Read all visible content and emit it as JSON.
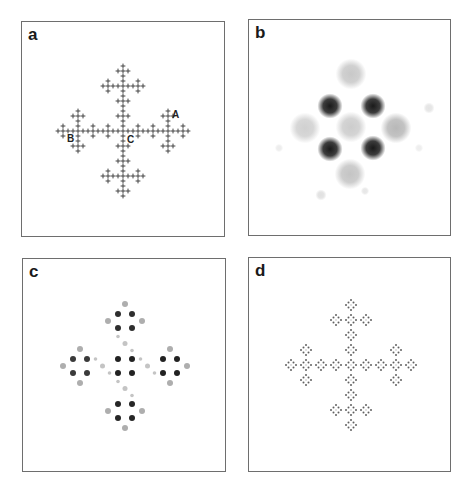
{
  "figure": {
    "panels": [
      {
        "id": "a",
        "label": "a",
        "box": {
          "x": 21,
          "y": 21,
          "w": 204,
          "h": 216
        },
        "type": "cross-fractal-plus",
        "center": [
          101,
          109
        ],
        "spacings": [
          45,
          15,
          5
        ],
        "glyph_size": 2.4,
        "color": "#444444",
        "point_labels": [
          {
            "text": "A",
            "x": 150,
            "y": 96
          },
          {
            "text": "B",
            "x": 45,
            "y": 120
          },
          {
            "text": "C",
            "x": 105,
            "y": 121
          }
        ]
      },
      {
        "id": "b",
        "label": "b",
        "box": {
          "x": 248,
          "y": 19,
          "w": 203,
          "h": 217
        },
        "type": "blobs",
        "blobs": [
          {
            "x": 81,
            "y": 86,
            "r": 9,
            "shade": "#1a1a1a"
          },
          {
            "x": 124,
            "y": 86,
            "r": 9,
            "shade": "#1a1a1a"
          },
          {
            "x": 81,
            "y": 129,
            "r": 9,
            "shade": "#1a1a1a"
          },
          {
            "x": 124,
            "y": 128,
            "r": 9,
            "shade": "#1a1a1a"
          },
          {
            "x": 102,
            "y": 54,
            "r": 11,
            "shade": "#c8c8c8"
          },
          {
            "x": 102,
            "y": 107,
            "r": 11,
            "shade": "#cccccc"
          },
          {
            "x": 56,
            "y": 108,
            "r": 11,
            "shade": "#d0d0d0"
          },
          {
            "x": 147,
            "y": 108,
            "r": 11,
            "shade": "#b8b8b8"
          },
          {
            "x": 101,
            "y": 154,
            "r": 11,
            "shade": "#c4c4c4"
          },
          {
            "x": 180,
            "y": 88,
            "r": 4,
            "shade": "#e4e4e4"
          },
          {
            "x": 30,
            "y": 128,
            "r": 3,
            "shade": "#ececec"
          },
          {
            "x": 72,
            "y": 175,
            "r": 4,
            "shade": "#e0e0e0"
          },
          {
            "x": 116,
            "y": 171,
            "r": 3,
            "shade": "#e6e6e6"
          },
          {
            "x": 170,
            "y": 128,
            "r": 3,
            "shade": "#ededed"
          }
        ]
      },
      {
        "id": "c",
        "label": "c",
        "box": {
          "x": 22,
          "y": 258,
          "w": 204,
          "h": 214
        },
        "type": "dot-clusters",
        "center": [
          102,
          107
        ],
        "arm_offset": 45,
        "inner_offset": 7,
        "outer_offset": 17,
        "arm_shades": {
          "up": "#2e2e2e",
          "down": "#262626",
          "left": "#3a3a3a",
          "right": "#222222",
          "center": "#222222"
        },
        "outer_shade": "#9a9a9a",
        "connector_shade": "#c4c4c4"
      },
      {
        "id": "d",
        "label": "d",
        "box": {
          "x": 248,
          "y": 257,
          "w": 203,
          "h": 215
        },
        "type": "cross-fractal-diamond",
        "center": [
          102,
          107
        ],
        "spacings": [
          45,
          15,
          5
        ],
        "dot_radius": 1.0,
        "color": "#3a3a3a"
      }
    ]
  }
}
